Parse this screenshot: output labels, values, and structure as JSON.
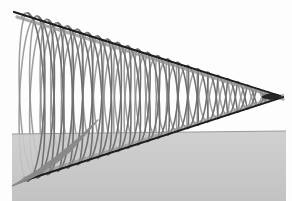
{
  "figure": {
    "type": "3d-geometry-plot",
    "width": 292,
    "height": 201,
    "background_color": "#fdfdfd"
  },
  "colors": {
    "background": "#fdfdfd",
    "helix_stroke": "#8a8a8a",
    "helix_stroke_dark": "#6f6f6f",
    "cone_edge_dark": "#1c1c1c",
    "cone_edge_gray": "#909090",
    "plane_fill_top": "#c9c9c9",
    "plane_fill_bottom": "#bdbdbd",
    "plane_edge": "#9a9a9a",
    "cone_shade": "#b8b8b8"
  },
  "cone": {
    "apex": {
      "x": 283,
      "y": 97
    },
    "base_center": {
      "x": 22,
      "y": 96
    },
    "base_radius_y": 86,
    "base_radius_x": 13,
    "upper_edge": {
      "x1": 14,
      "y1": 12,
      "x2": 283,
      "y2": 97
    },
    "lower_edge": {
      "x1": 20,
      "y1": 182,
      "x2": 283,
      "y2": 97
    },
    "axis_label": "cone axis",
    "opening_direction": "left"
  },
  "helix": {
    "name": "conical-helix",
    "turns": 13,
    "points_per_turn": 48,
    "stroke_width": 1.6,
    "description": "helix wound on the surface of a cone, dense near apex, wide near base"
  },
  "plane": {
    "name": "ground-plane",
    "label": "horizontal plane",
    "left": 12,
    "top": 132,
    "right": 286,
    "bottom": 201,
    "top_edge_left_y": 134,
    "top_edge_right_y": 131,
    "opacity": 0.86
  },
  "annotations": {
    "apex_label": "apex",
    "base_label": "base",
    "plane_label": "plane"
  },
  "chart_data": {
    "type": "line",
    "xlabel": "",
    "ylabel": "",
    "xlim": [
      0,
      292
    ],
    "ylim": [
      0,
      201
    ],
    "grid": false,
    "legend": "none",
    "series": [
      {
        "name": "conical helix",
        "parametric": true,
        "equations": {
          "x": "apex.x + (base.x - apex.x) * t",
          "y": "apex.y + A * t * sin(2*pi*turns*t)",
          "z_depth": "A * t * cos(2*pi*turns*t)"
        },
        "turns": 13,
        "t_range": [
          0,
          1
        ],
        "amplitude_max": 86,
        "color": "#8a8a8a"
      },
      {
        "name": "cone upper generatrix",
        "points": [
          [
            14,
            12
          ],
          [
            283,
            97
          ]
        ],
        "color": "#1c1c1c"
      },
      {
        "name": "cone lower generatrix",
        "points": [
          [
            20,
            182
          ],
          [
            283,
            97
          ]
        ],
        "color": "#1c1c1c"
      },
      {
        "name": "ground plane polygon",
        "points": [
          [
            12,
            134
          ],
          [
            286,
            131
          ],
          [
            286,
            201
          ],
          [
            12,
            201
          ]
        ],
        "color": "#c4c4c4"
      }
    ]
  }
}
